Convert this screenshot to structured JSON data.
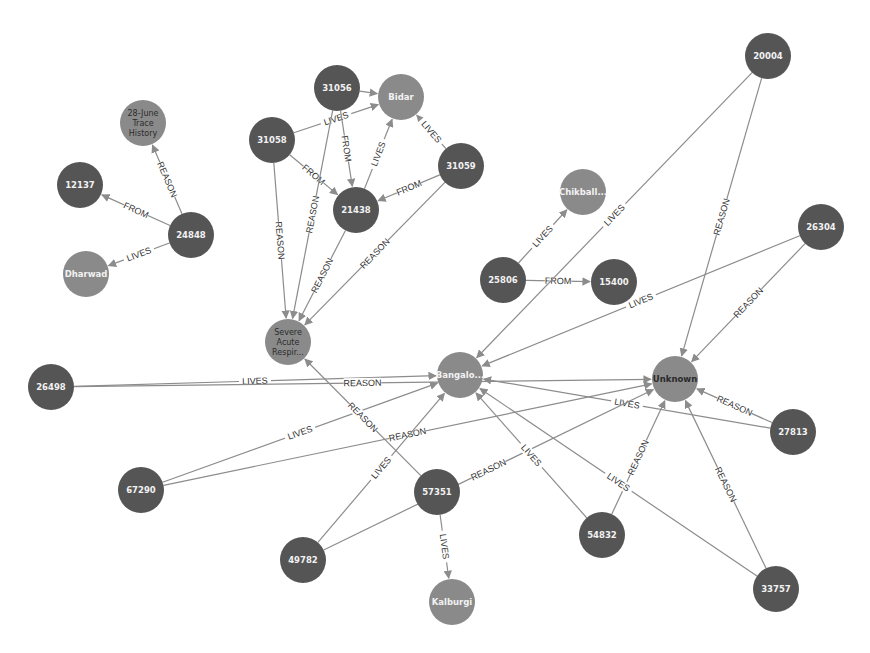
{
  "colors": {
    "person_node": "#555555",
    "place_node": "#8a8a8a",
    "edge": "#8c8c8c",
    "light_text": "#f2f2f2",
    "dark_text": "#2a2a2a",
    "background": "#ffffff"
  },
  "graph": {
    "node_radius": 23,
    "nodes": [
      {
        "id": "28june",
        "lines": [
          "28-June",
          "Trace",
          "History"
        ],
        "type": "place",
        "x": 143,
        "y": 123,
        "text": "dark"
      },
      {
        "id": "12137",
        "lines": [
          "12137"
        ],
        "type": "person",
        "x": 80,
        "y": 185
      },
      {
        "id": "24848",
        "lines": [
          "24848"
        ],
        "type": "person",
        "x": 191,
        "y": 235
      },
      {
        "id": "dharwad",
        "lines": [
          "Dharwad"
        ],
        "type": "place",
        "x": 86,
        "y": 274
      },
      {
        "id": "31056",
        "lines": [
          "31056"
        ],
        "type": "person",
        "x": 337,
        "y": 88
      },
      {
        "id": "bidar",
        "lines": [
          "Bidar"
        ],
        "type": "place",
        "x": 401,
        "y": 97
      },
      {
        "id": "31058",
        "lines": [
          "31058"
        ],
        "type": "person",
        "x": 272,
        "y": 140
      },
      {
        "id": "31059",
        "lines": [
          "31059"
        ],
        "type": "person",
        "x": 461,
        "y": 166
      },
      {
        "id": "21438",
        "lines": [
          "21438"
        ],
        "type": "person",
        "x": 356,
        "y": 210
      },
      {
        "id": "severe",
        "lines": [
          "Severe",
          "Acute",
          "Respir..."
        ],
        "type": "place",
        "x": 288,
        "y": 342,
        "text": "dark"
      },
      {
        "id": "chikball",
        "lines": [
          "Chikball..."
        ],
        "type": "place",
        "x": 583,
        "y": 192
      },
      {
        "id": "25806",
        "lines": [
          "25806"
        ],
        "type": "person",
        "x": 503,
        "y": 280
      },
      {
        "id": "15400",
        "lines": [
          "15400"
        ],
        "type": "person",
        "x": 614,
        "y": 282
      },
      {
        "id": "20004",
        "lines": [
          "20004"
        ],
        "type": "person",
        "x": 768,
        "y": 56
      },
      {
        "id": "26304",
        "lines": [
          "26304"
        ],
        "type": "person",
        "x": 821,
        "y": 227
      },
      {
        "id": "bangalore",
        "lines": [
          "Bangalo..."
        ],
        "type": "place",
        "x": 460,
        "y": 375
      },
      {
        "id": "unknown",
        "lines": [
          "Unknown"
        ],
        "type": "place",
        "x": 675,
        "y": 379,
        "text": "dark"
      },
      {
        "id": "26498",
        "lines": [
          "26498"
        ],
        "type": "person",
        "x": 51,
        "y": 387
      },
      {
        "id": "27813",
        "lines": [
          "27813"
        ],
        "type": "person",
        "x": 793,
        "y": 432
      },
      {
        "id": "67290",
        "lines": [
          "67290"
        ],
        "type": "person",
        "x": 141,
        "y": 490
      },
      {
        "id": "57351",
        "lines": [
          "57351"
        ],
        "type": "person",
        "x": 437,
        "y": 492
      },
      {
        "id": "49782",
        "lines": [
          "49782"
        ],
        "type": "person",
        "x": 303,
        "y": 560
      },
      {
        "id": "54832",
        "lines": [
          "54832"
        ],
        "type": "person",
        "x": 602,
        "y": 535
      },
      {
        "id": "kalburgi",
        "lines": [
          "Kalburgi"
        ],
        "type": "place",
        "x": 452,
        "y": 602
      },
      {
        "id": "33757",
        "lines": [
          "33757"
        ],
        "type": "person",
        "x": 776,
        "y": 589
      }
    ],
    "edges": [
      {
        "from": "24848",
        "to": "28june",
        "label": "REASON"
      },
      {
        "from": "24848",
        "to": "12137",
        "label": "FROM"
      },
      {
        "from": "24848",
        "to": "dharwad",
        "label": "LIVES"
      },
      {
        "from": "31056",
        "to": "bidar",
        "label": ""
      },
      {
        "from": "31058",
        "to": "bidar",
        "label": "LIVES"
      },
      {
        "from": "31056",
        "to": "21438",
        "label": "FROM"
      },
      {
        "from": "31058",
        "to": "21438",
        "label": "FROM"
      },
      {
        "from": "21438",
        "to": "bidar",
        "label": "LIVES"
      },
      {
        "from": "31059",
        "to": "bidar",
        "label": "LIVES"
      },
      {
        "from": "31059",
        "to": "21438",
        "label": "FROM"
      },
      {
        "from": "31058",
        "to": "severe",
        "label": "REASON"
      },
      {
        "from": "31056",
        "to": "severe",
        "label": "REASON"
      },
      {
        "from": "21438",
        "to": "severe",
        "label": "REASON"
      },
      {
        "from": "31059",
        "to": "severe",
        "label": "REASON"
      },
      {
        "from": "25806",
        "to": "chikball",
        "label": "LIVES"
      },
      {
        "from": "25806",
        "to": "15400",
        "label": "FROM"
      },
      {
        "from": "20004",
        "to": "bangalore",
        "label": "LIVES"
      },
      {
        "from": "20004",
        "to": "unknown",
        "label": "REASON"
      },
      {
        "from": "26304",
        "to": "bangalore",
        "label": "LIVES"
      },
      {
        "from": "26304",
        "to": "unknown",
        "label": "REASON"
      },
      {
        "from": "26498",
        "to": "bangalore",
        "label": "LIVES"
      },
      {
        "from": "26498",
        "to": "unknown",
        "label": "REASON"
      },
      {
        "from": "27813",
        "to": "unknown",
        "label": "REASON"
      },
      {
        "from": "27813",
        "to": "bangalore",
        "label": "LIVES"
      },
      {
        "from": "67290",
        "to": "bangalore",
        "label": "LIVES"
      },
      {
        "from": "67290",
        "to": "unknown",
        "label": "REASON"
      },
      {
        "from": "57351",
        "to": "severe",
        "label": "REASON"
      },
      {
        "from": "57351",
        "to": "kalburgi",
        "label": "LIVES"
      },
      {
        "from": "49782",
        "to": "bangalore",
        "label": "LIVES"
      },
      {
        "from": "49782",
        "to": "unknown",
        "label": "REASON"
      },
      {
        "from": "54832",
        "to": "bangalore",
        "label": "LIVES"
      },
      {
        "from": "54832",
        "to": "unknown",
        "label": "REASON"
      },
      {
        "from": "33757",
        "to": "bangalore",
        "label": "LIVES"
      },
      {
        "from": "33757",
        "to": "unknown",
        "label": "REASON"
      }
    ]
  }
}
